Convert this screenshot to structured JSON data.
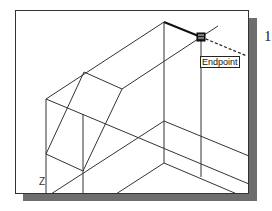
{
  "viewport": {
    "snap_tooltip": "Endpoint",
    "ucs_axis_label": "Z"
  },
  "annotation": {
    "step_number": "1"
  },
  "colors": {
    "line": "#333333",
    "shadow": "#6e6e6e",
    "background": "#ffffff"
  }
}
